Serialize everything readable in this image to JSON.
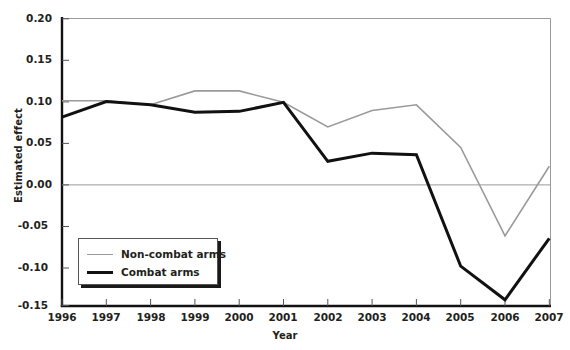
{
  "chart_data": {
    "type": "line",
    "title": "",
    "xlabel": "Year",
    "ylabel": "Estimated effect",
    "categories": [
      "1996",
      "1997",
      "1998",
      "1999",
      "2000",
      "2001",
      "2002",
      "2003",
      "2004",
      "2005",
      "2006",
      "2007"
    ],
    "x": [
      1996,
      1997,
      1998,
      1999,
      2000,
      2001,
      2002,
      2003,
      2004,
      2005,
      2006,
      2007
    ],
    "xlim": [
      1996,
      2007
    ],
    "ylim": [
      -0.15,
      0.2
    ],
    "yticks": [
      0.2,
      0.15,
      0.1,
      0.05,
      0.0,
      -0.05,
      -0.1,
      -0.15
    ],
    "ytick_labels": [
      "0.20",
      "0.15",
      "0.10",
      "0.05",
      "0.00",
      "-0.05",
      "-0.10",
      "-0.15"
    ],
    "grid": false,
    "zero_line": true,
    "legend_position": "lower-left",
    "series": [
      {
        "name": "Non-combat arms",
        "color": "#9a9a9a",
        "width": 1.6,
        "values": [
          0.1,
          0.1,
          0.095,
          0.112,
          0.112,
          0.098,
          0.068,
          0.088,
          0.095,
          0.043,
          -0.065,
          0.02
        ]
      },
      {
        "name": "Combat arms",
        "color": "#111111",
        "width": 3.0,
        "values": [
          0.08,
          0.099,
          0.095,
          0.086,
          0.087,
          0.098,
          0.026,
          0.036,
          0.034,
          -0.102,
          -0.143,
          -0.068
        ]
      }
    ]
  },
  "legend": {
    "entries": [
      {
        "label": "Non-combat arms"
      },
      {
        "label": "Combat arms"
      }
    ]
  },
  "axes": {
    "y_title": "Estimated effect",
    "x_title": "Year",
    "ytick_0": "0.20",
    "ytick_1": "0.15",
    "ytick_2": "0.10",
    "ytick_3": "0.05",
    "ytick_4": "0.00",
    "ytick_5": "-0.05",
    "ytick_6": "-0.10",
    "ytick_7": "-0.15",
    "xtick_0": "1996",
    "xtick_1": "1997",
    "xtick_2": "1998",
    "xtick_3": "1999",
    "xtick_4": "2000",
    "xtick_5": "2001",
    "xtick_6": "2002",
    "xtick_7": "2003",
    "xtick_8": "2004",
    "xtick_9": "2005",
    "xtick_10": "2006",
    "xtick_11": "2007"
  }
}
